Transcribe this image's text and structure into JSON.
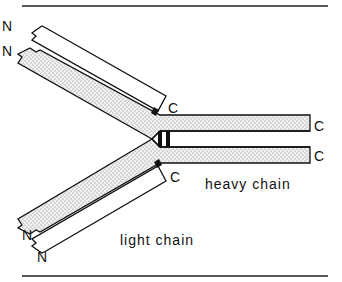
{
  "diagram": {
    "labels": {
      "n_terminus": "N",
      "c_terminus": "C",
      "heavy_chain": "heavy chain",
      "light_chain": "light chain"
    },
    "terminus_labels": {
      "upper_light_N": "N",
      "upper_heavy_N": "N",
      "upper_light_C": "C",
      "heavy_upper_C": "C",
      "heavy_lower_C": "C",
      "lower_light_C": "C",
      "lower_heavy_N": "N",
      "lower_light_N": "N"
    },
    "colors": {
      "line": "#111111",
      "heavy_fill": "#ececec",
      "light_fill": "#ffffff",
      "disulfide": "#111111"
    }
  }
}
